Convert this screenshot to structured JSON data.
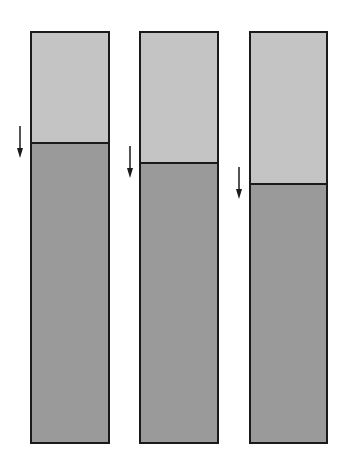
{
  "diagram": {
    "colors": {
      "upper": "#c4c4c4",
      "lower": "#9a9a9a",
      "outline": "#1a1a1a",
      "background": "#ffffff"
    },
    "columns": [
      {
        "id": 1,
        "left": 30,
        "top": 31,
        "width": 80,
        "height": 413,
        "boundary_y": 142,
        "arrow": {
          "x": 20,
          "y1": 126,
          "y2": 158
        }
      },
      {
        "id": 2,
        "left": 139,
        "top": 31,
        "width": 80,
        "height": 413,
        "boundary_y": 162,
        "arrow": {
          "x": 130,
          "y1": 146,
          "y2": 178
        }
      },
      {
        "id": 3,
        "left": 249,
        "top": 31,
        "width": 79,
        "height": 413,
        "boundary_y": 183,
        "arrow": {
          "x": 239,
          "y1": 167,
          "y2": 199
        }
      }
    ]
  }
}
